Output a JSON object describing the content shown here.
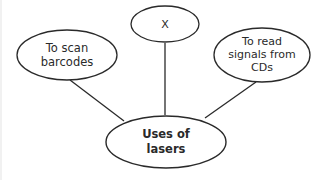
{
  "diagram": {
    "type": "mind-map",
    "center": {
      "label_lines": [
        "Uses of",
        "lasers"
      ]
    },
    "branches": [
      {
        "id": "left",
        "label_lines": [
          "To scan",
          "barcodes"
        ]
      },
      {
        "id": "top",
        "label_lines": [
          "X"
        ]
      },
      {
        "id": "right",
        "label_lines": [
          "To read",
          "signals from",
          "CDs"
        ]
      }
    ],
    "colors": {
      "stroke": "#2a2a2a",
      "text": "#2a2a2a",
      "background": "#ffffff"
    }
  }
}
